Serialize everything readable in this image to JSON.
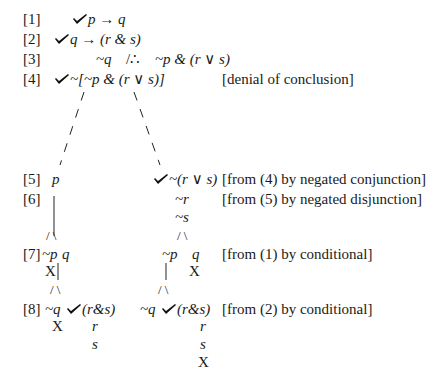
{
  "lines": {
    "l1": {
      "label": "[1]",
      "formula": "p → q",
      "checked": true
    },
    "l2": {
      "label": "[2]",
      "formula_a": "q → (r & s)",
      "checked": true
    },
    "l3": {
      "label": "[3]",
      "premise": "~q",
      "therefore": "/∴",
      "conclusion": "~p & (r ∨ s)"
    },
    "l4": {
      "label": "[4]",
      "formula": "~[~p & (r ∨ s)]",
      "checked": true,
      "justification": "[denial of conclusion]"
    },
    "l5": {
      "label": "[5]",
      "left": "p",
      "right": "~(r ∨ s)",
      "right_checked": true,
      "justification": "[from (4) by negated conjunction]"
    },
    "l6": {
      "label": "[6]",
      "right_a": "~r",
      "right_b": "~s",
      "justification": "[from (5) by negated disjunction]"
    },
    "l7": {
      "label": "[7]",
      "left_a": "~p",
      "left_b": "q",
      "right_a": "~p",
      "right_b": "q",
      "closed": "X",
      "justification": "[from (1) by conditional]"
    },
    "l8": {
      "label": "[8]",
      "left_a": "~q",
      "left_b": "(r&s)",
      "right_a": "~q",
      "right_b": "(r&s)",
      "r": "r",
      "s": "s",
      "closed": "X",
      "justification": "[from (2) by conditional]"
    }
  },
  "symbols": {
    "slash": "/",
    "backslash": "\\",
    "bar": "|",
    "closed": "X"
  }
}
